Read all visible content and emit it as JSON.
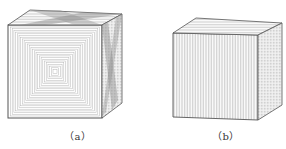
{
  "figure": {
    "panels": [
      {
        "id": "a",
        "label": "（a）",
        "description": "cube with concentric square contour hatching on front face and crossed diagonal hatching on top and side faces"
      },
      {
        "id": "b",
        "label": "（b）",
        "description": "cube with parallel line hatching on all faces"
      }
    ]
  },
  "colors": {
    "line": "#7a7a7a",
    "edge": "#555555",
    "dark_hatch": "#8a8a8a"
  }
}
